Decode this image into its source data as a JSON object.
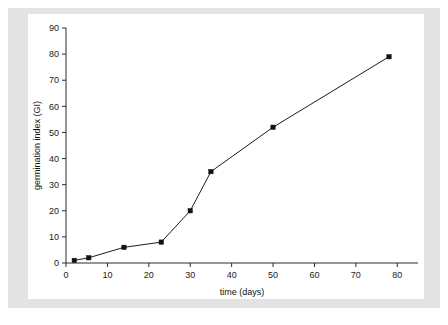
{
  "figure": {
    "background_color": "#ffffff",
    "mat_color": "#e3e3e3",
    "canvas_color": "#ffffff",
    "caption_fragment": ""
  },
  "chart_data": {
    "type": "line",
    "title": "",
    "subtitle": "",
    "xlabel": "time (days)",
    "ylabel": "germination index (GI)",
    "xlim": [
      0,
      85
    ],
    "ylim": [
      0,
      90
    ],
    "xticks": [
      0,
      10,
      20,
      30,
      40,
      50,
      60,
      70,
      80
    ],
    "yticks": [
      0,
      10,
      20,
      30,
      40,
      50,
      60,
      70,
      80,
      90
    ],
    "xtick_labels": [
      "0",
      "10",
      "20",
      "30",
      "40",
      "50",
      "60",
      "70",
      "80"
    ],
    "ytick_labels": [
      "0",
      "10",
      "20",
      "30",
      "40",
      "50",
      "60",
      "70",
      "80",
      "90"
    ],
    "grid": false,
    "legend": null,
    "legend_position": "none",
    "marker": "square",
    "marker_color": "#111111",
    "line_color": "#1c1c1c",
    "series": [
      {
        "name": "germination index",
        "x": [
          2,
          5.5,
          14,
          23,
          30,
          35,
          50,
          78
        ],
        "values": [
          1,
          2,
          6,
          8,
          20,
          35,
          52,
          79
        ]
      }
    ]
  }
}
